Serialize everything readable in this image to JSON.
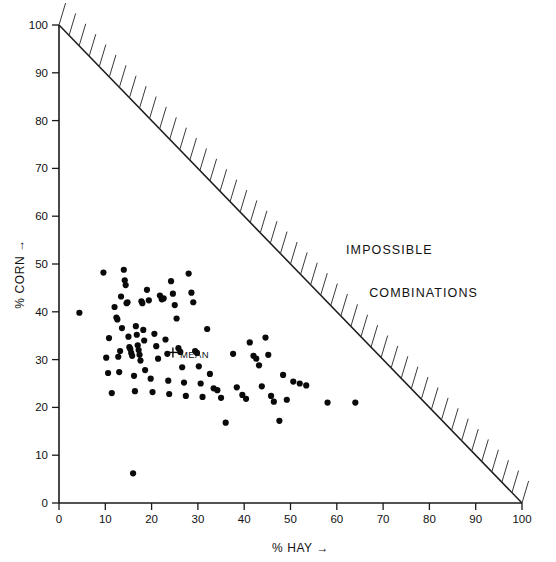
{
  "chart_data": {
    "type": "scatter",
    "title": "",
    "xlabel": "% HAY",
    "xlabel_arrow": "→",
    "ylabel": "% CORN",
    "ylabel_arrow": "→",
    "xlim": [
      0,
      100
    ],
    "ylim": [
      0,
      100
    ],
    "grid": false,
    "legend": false,
    "xticks": [
      0,
      10,
      20,
      30,
      40,
      50,
      60,
      70,
      80,
      90,
      100
    ],
    "yticks": [
      0,
      10,
      20,
      30,
      40,
      50,
      60,
      70,
      80,
      90,
      100
    ],
    "xtick_labels": [
      "0",
      "10",
      "20",
      "30",
      "40",
      "50",
      "60",
      "70",
      "80",
      "90",
      "100"
    ],
    "ytick_labels": [
      "0",
      "10",
      "20",
      "30",
      "40",
      "50",
      "60",
      "70",
      "80",
      "90",
      "100"
    ],
    "annotations": [
      {
        "name": "impossible",
        "text": "IMPOSSIBLE",
        "x": 62,
        "y": 52
      },
      {
        "name": "combinations",
        "text": "COMBINATIONS",
        "x": 67,
        "y": 43
      },
      {
        "name": "mean-label",
        "text": "MEAN",
        "x": 26.5,
        "y": 31
      }
    ],
    "constraint_line": {
      "name": "corn-plus-hay-equals-100",
      "from": [
        0,
        100
      ],
      "to": [
        100,
        0
      ],
      "hatched_side": "upper-right",
      "hatch_count": 46
    },
    "mean_marker": {
      "symbol": "+",
      "x": 24.6,
      "y": 31.5
    },
    "series": [
      {
        "name": "farms",
        "marker": "filled-circle",
        "color": "#0a0a0a",
        "n": 96,
        "points": [
          [
            4.4,
            39.8
          ],
          [
            9.6,
            48.2
          ],
          [
            10.2,
            30.4
          ],
          [
            10.6,
            27.2
          ],
          [
            10.8,
            34.5
          ],
          [
            11.4,
            23.0
          ],
          [
            12.0,
            41.0
          ],
          [
            12.4,
            38.8
          ],
          [
            12.6,
            38.4
          ],
          [
            12.8,
            30.6
          ],
          [
            13.0,
            27.4
          ],
          [
            13.2,
            31.8
          ],
          [
            13.4,
            43.2
          ],
          [
            13.6,
            36.6
          ],
          [
            14.0,
            48.8
          ],
          [
            14.2,
            46.6
          ],
          [
            14.4,
            45.6
          ],
          [
            14.6,
            41.8
          ],
          [
            14.8,
            42.0
          ],
          [
            15.0,
            34.8
          ],
          [
            15.2,
            32.6
          ],
          [
            15.4,
            32.2
          ],
          [
            15.6,
            31.4
          ],
          [
            15.8,
            30.8
          ],
          [
            16.0,
            6.2
          ],
          [
            16.2,
            26.6
          ],
          [
            16.4,
            23.4
          ],
          [
            16.6,
            37.0
          ],
          [
            16.8,
            35.2
          ],
          [
            17.0,
            33.0
          ],
          [
            17.2,
            32.0
          ],
          [
            17.4,
            31.0
          ],
          [
            17.6,
            29.8
          ],
          [
            17.8,
            42.2
          ],
          [
            18.0,
            41.8
          ],
          [
            18.2,
            36.2
          ],
          [
            18.4,
            34.0
          ],
          [
            18.6,
            27.8
          ],
          [
            19.0,
            44.6
          ],
          [
            19.4,
            42.4
          ],
          [
            19.8,
            26.0
          ],
          [
            20.2,
            23.2
          ],
          [
            20.6,
            35.4
          ],
          [
            21.0,
            32.8
          ],
          [
            21.4,
            30.2
          ],
          [
            21.8,
            43.4
          ],
          [
            22.2,
            42.6
          ],
          [
            22.6,
            42.8
          ],
          [
            23.0,
            34.2
          ],
          [
            23.4,
            31.2
          ],
          [
            23.6,
            25.6
          ],
          [
            23.8,
            22.8
          ],
          [
            24.2,
            46.4
          ],
          [
            24.6,
            43.8
          ],
          [
            25.0,
            41.4
          ],
          [
            25.4,
            38.6
          ],
          [
            25.8,
            32.4
          ],
          [
            26.2,
            31.6
          ],
          [
            26.6,
            28.4
          ],
          [
            27.0,
            25.2
          ],
          [
            27.4,
            22.4
          ],
          [
            28.0,
            48.0
          ],
          [
            28.6,
            44.0
          ],
          [
            29.0,
            42.0
          ],
          [
            29.4,
            31.8
          ],
          [
            29.8,
            31.4
          ],
          [
            30.2,
            28.6
          ],
          [
            30.6,
            25.0
          ],
          [
            31.0,
            22.2
          ],
          [
            32.0,
            36.4
          ],
          [
            32.6,
            27.0
          ],
          [
            33.4,
            24.0
          ],
          [
            34.2,
            23.6
          ],
          [
            35.0,
            22.0
          ],
          [
            36.0,
            16.8
          ],
          [
            37.6,
            31.2
          ],
          [
            38.4,
            24.2
          ],
          [
            39.6,
            22.6
          ],
          [
            40.4,
            21.8
          ],
          [
            41.2,
            33.6
          ],
          [
            42.0,
            30.8
          ],
          [
            42.6,
            30.2
          ],
          [
            43.2,
            28.8
          ],
          [
            43.8,
            24.4
          ],
          [
            44.6,
            34.6
          ],
          [
            45.2,
            31.0
          ],
          [
            45.8,
            22.4
          ],
          [
            46.4,
            21.2
          ],
          [
            47.6,
            17.2
          ],
          [
            48.4,
            26.8
          ],
          [
            49.2,
            21.6
          ],
          [
            50.6,
            25.4
          ],
          [
            52.0,
            25.0
          ],
          [
            53.4,
            24.6
          ],
          [
            58.0,
            21.0
          ],
          [
            64.0,
            21.0
          ]
        ]
      }
    ]
  }
}
